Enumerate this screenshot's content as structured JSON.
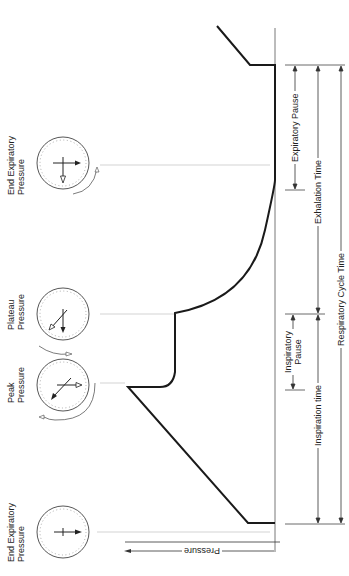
{
  "gauges": [
    {
      "id": "eep-top",
      "label_line1": "End Expiratory",
      "label_line2": "Pressure"
    },
    {
      "id": "plateau",
      "label_line1": "Plateau",
      "label_line2": "Pressure"
    },
    {
      "id": "peak",
      "label_line1": "Peak",
      "label_line2": "Pressure"
    },
    {
      "id": "eep-bottom",
      "label_line1": "End Expiratory",
      "label_line2": "Pressure"
    }
  ],
  "axis": {
    "pressure_label": "Pressure"
  },
  "timings": {
    "expiratory_pause": "Expiratory Pause",
    "exhalation_time": "Exhalation Time",
    "respiratory_cycle_time": "Respiratory Cycle Time",
    "inspiratory_pause_line1": "Inspiratory",
    "inspiratory_pause_line2": "Pause",
    "inspiration_time": "Inspiration time"
  },
  "colors": {
    "stroke": "#1a1a1a",
    "guide": "#bdbdbd",
    "text": "#222222"
  }
}
